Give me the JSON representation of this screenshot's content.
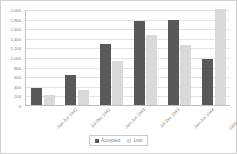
{
  "chart_data": {
    "type": "bar",
    "title": "",
    "subtitle": "",
    "xlabel": "",
    "ylabel": "",
    "grid": true,
    "legend_position": "bottom-center",
    "ylim": [
      0,
      2000
    ],
    "ytick_labels": [
      "2,000",
      "1,800",
      "1,600",
      "1,400",
      "1,200",
      "1,000",
      "800",
      "600",
      "400",
      "200",
      "0"
    ],
    "ytick_values": [
      2000,
      1800,
      1600,
      1400,
      1200,
      1000,
      800,
      600,
      400,
      200,
      0
    ],
    "categories": [
      "Jan-Jun 1942",
      "Jul-Dec 1942",
      "Jan-Jun 1943",
      "Jul-Dec 1943",
      "Jan-Jun 1944",
      "1944 (Jan-Oct)"
    ],
    "series": [
      {
        "name": "Accepted",
        "color": "#595959",
        "values": [
          350,
          620,
          1280,
          1760,
          1780,
          960
        ]
      },
      {
        "name": "Lost",
        "color": "#d9d9d9",
        "values": [
          200,
          320,
          910,
          1460,
          1240,
          1990
        ]
      }
    ]
  },
  "legend": {
    "entries": [
      {
        "label": "Accepted"
      },
      {
        "label": "Lost"
      }
    ]
  }
}
